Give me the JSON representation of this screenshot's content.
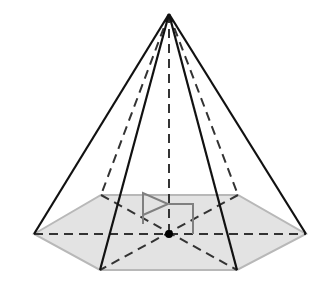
{
  "diagram": {
    "colors": {
      "base_fill": "#e3e3e3",
      "base_edge": "#b8b8b8",
      "edge": "#111111",
      "hidden": "#333333",
      "marker": "#808080"
    },
    "apex": [
      169,
      14
    ],
    "center": [
      169,
      234
    ],
    "base_vertices": [
      [
        34,
        234
      ],
      [
        101,
        195
      ],
      [
        238,
        195
      ],
      [
        306,
        234
      ],
      [
        237,
        270
      ],
      [
        100,
        270
      ]
    ],
    "visible_lateral_edges": [
      "apex-left",
      "apex-right",
      "apex-front-left",
      "apex-front-right"
    ],
    "hidden_lateral_edges": [
      "apex-back-left",
      "apex-back-right",
      "apex-center"
    ]
  }
}
